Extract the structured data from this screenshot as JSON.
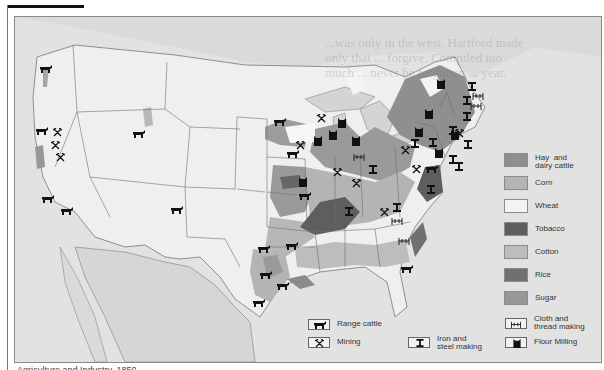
{
  "caption": "Agriculture and Industry, 1850",
  "legend": {
    "crops": [
      {
        "label": "Hay  and\ndairy cattle",
        "color": "#8f8f8f",
        "key": "hay-dairy"
      },
      {
        "label": "Corn",
        "color": "#b4b4b4",
        "key": "corn"
      },
      {
        "label": "Wheat",
        "color": "#f3f3f3",
        "key": "wheat"
      },
      {
        "label": "Tobacco",
        "color": "#5e5e5e",
        "key": "tobacco"
      },
      {
        "label": "Cotton",
        "color": "#bdbdbd",
        "key": "cotton"
      },
      {
        "label": "Rice",
        "color": "#707070",
        "key": "rice"
      },
      {
        "label": "Sugar",
        "color": "#989898",
        "key": "sugar"
      }
    ],
    "symbols": [
      {
        "label": "Range cattle",
        "icon": "cattle-icon"
      },
      {
        "label": "Mining",
        "icon": "mining-icon"
      },
      {
        "label": "Iron and\nsteel making",
        "icon": "iron-steel-icon"
      },
      {
        "label": "Cloth and\nthread making",
        "icon": "cloth-thread-icon"
      },
      {
        "label": "Flour Milling",
        "icon": "flour-mill-icon"
      }
    ]
  },
  "colors": {
    "background": "#e4e4e4",
    "land": "#ececec",
    "water": "#d9d9d9",
    "border_line": "#6e6e6e",
    "symbol": "#111111"
  },
  "ghost_text": "...was only in the west. Hartford made only that ... forgive. Compiled too much ... never be forgotten ... year."
}
